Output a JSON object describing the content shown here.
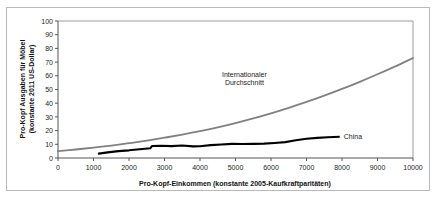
{
  "chart_data": {
    "type": "line",
    "title": "",
    "xlabel": "Pro-Kopf-Einkommen (konstante 2005-Kaufkraftparitäten)",
    "ylabel": "Pro-Kopf Ausgaben für Möbel (konstante 2011 US-Dollar)",
    "ylabel_line1": "Pro-Kopf Ausgaben für Möbel",
    "ylabel_line2": "(konstante 2011 US-Dollar)",
    "xlim": [
      0,
      10000
    ],
    "ylim": [
      0,
      100
    ],
    "xticks": [
      "0",
      "1000",
      "2000",
      "3000",
      "4000",
      "5000",
      "6000",
      "7000",
      "8000",
      "9000",
      "10000"
    ],
    "xtick_values": [
      0,
      1000,
      2000,
      3000,
      4000,
      5000,
      6000,
      7000,
      8000,
      9000,
      10000
    ],
    "yticks": [
      "0",
      "10",
      "20",
      "30",
      "40",
      "50",
      "60",
      "70",
      "80",
      "90",
      "100"
    ],
    "ytick_values": [
      0,
      10,
      20,
      30,
      40,
      50,
      60,
      70,
      80,
      90,
      100
    ],
    "grid": false,
    "legend_position": "inline-annotations",
    "series": [
      {
        "name": "Internationaler Durchschnitt",
        "color": "#808080",
        "width": 1.8,
        "label_x": 5250,
        "label_y": 59,
        "x": [
          0,
          500,
          1000,
          1500,
          2000,
          2500,
          3000,
          3500,
          4000,
          4500,
          5000,
          5500,
          6000,
          6500,
          7000,
          7500,
          8000,
          8500,
          9000,
          9500,
          10000
        ],
        "y": [
          5.0,
          6.2,
          7.6,
          9.1,
          10.8,
          12.7,
          14.8,
          17.1,
          19.6,
          22.4,
          25.5,
          28.9,
          32.6,
          36.6,
          40.9,
          45.5,
          50.4,
          55.6,
          61.1,
          66.9,
          73.0
        ]
      },
      {
        "name": "China",
        "color": "#000000",
        "width": 2.1,
        "label_x": 8050,
        "label_y": 15.5,
        "x": [
          1150,
          1400,
          1700,
          2000,
          2300,
          2600,
          2650,
          2900,
          3200,
          3500,
          3800,
          4000,
          4300,
          4600,
          4900,
          5200,
          5500,
          5800,
          6100,
          6400,
          6700,
          7000,
          7300,
          7600
        ],
        "y": [
          3.2,
          4.1,
          5.0,
          5.6,
          6.4,
          7.1,
          8.8,
          8.9,
          8.7,
          9.1,
          8.5,
          8.6,
          9.4,
          9.9,
          10.3,
          10.2,
          10.3,
          10.5,
          11.0,
          11.6,
          13.0,
          14.0,
          14.7,
          15.2
        ]
      }
    ]
  },
  "annotations": {
    "international_line1": "Internationaler",
    "international_line2": "Durchschnitt",
    "china": "China"
  }
}
